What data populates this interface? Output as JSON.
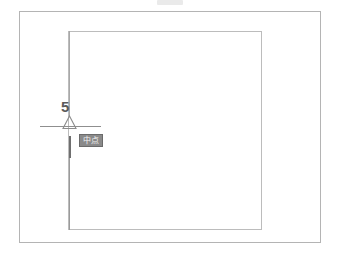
{
  "canvas": {
    "width": 339,
    "height": 262,
    "background_color": "#ffffff"
  },
  "drawing": {
    "outer_rectangle": {
      "name": "outer-rectangle",
      "stroke_color": "#b4b4b4",
      "x": 19,
      "y": 11,
      "width": 302,
      "height": 232
    },
    "inner_rectangle": {
      "name": "inner-rectangle",
      "stroke_color": "#bcbcbc",
      "x": 68,
      "y": 31,
      "width": 194,
      "height": 199
    },
    "vertical_tracking_line": {
      "name": "vertical-tracking-line",
      "stroke_color": "#a8a8a8",
      "x": 69,
      "y_start": 31,
      "y_end": 230
    },
    "horizontal_tracking_line": {
      "name": "horizontal-tracking-line",
      "stroke_color": "#8f8f8f",
      "y": 126,
      "x_start": 40,
      "x_end": 101
    }
  },
  "annotations": {
    "dimension_label": {
      "text": "5",
      "color": "#5a5a5a"
    },
    "snap_marker": {
      "type": "midpoint-triangle",
      "stroke_color": "#8c8c8c",
      "fill": "none"
    },
    "snap_tooltip": {
      "text": "中点",
      "background_color": "#8a8a8a",
      "border_color": "#6b6b6b",
      "text_color": "#f2f2f2"
    }
  }
}
